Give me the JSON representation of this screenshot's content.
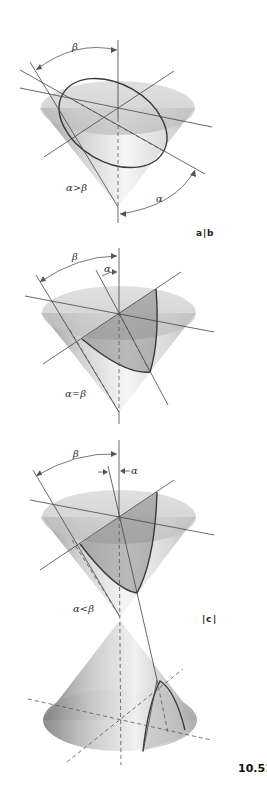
{
  "figure": {
    "number": "10.51",
    "colors": {
      "cone_light": "#f2f2f2",
      "cone_dark": "#9a9a9a",
      "section": "#7d7d7d",
      "line": "#444444"
    }
  },
  "panels": [
    {
      "id": "a",
      "condition": "α>β",
      "section_curve": "ellipse",
      "angle_labels": {
        "beta": "β",
        "alpha": "α"
      }
    },
    {
      "id": "b",
      "condition": "α=β",
      "section_curve": "parabola",
      "angle_labels": {
        "beta": "β",
        "alpha": "α"
      }
    },
    {
      "id": "c",
      "condition": "α<β",
      "section_curve": "hyperbola",
      "angle_labels": {
        "beta": "β",
        "alpha": "α"
      }
    }
  ],
  "panel_labels": {
    "ab": {
      "left": "a",
      "sep": "|",
      "right": "b"
    },
    "c": {
      "left_sep": "|",
      "label": "c",
      "right_sep": "|"
    }
  }
}
